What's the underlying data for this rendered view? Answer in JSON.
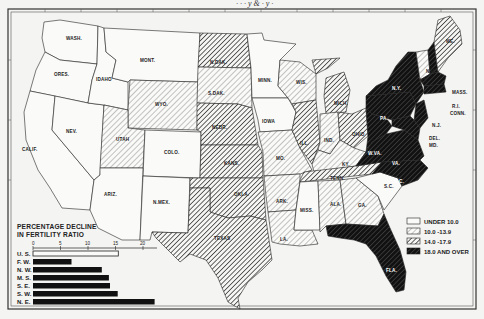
{
  "header": {
    "caption_fragment": "· ·  · y &  · y ·"
  },
  "colors": {
    "background": "#f4f4f2",
    "ink": "#1a1a1a",
    "under_10": "#ffffff",
    "10_13_9": "light-hatch",
    "14_17_9": "medium-hatch",
    "18_and_over": "dark-hatch"
  },
  "map": {
    "title": "Percentage decline in fertility ratio by state",
    "states": [
      {
        "label": "WASH.",
        "category": "under_10"
      },
      {
        "label": "ORES.",
        "category": "under_10"
      },
      {
        "label": "CALIF.",
        "category": "under_10"
      },
      {
        "label": "NEV.",
        "category": "under_10"
      },
      {
        "label": "IDAHO",
        "category": "under_10"
      },
      {
        "label": "MONT.",
        "category": "under_10"
      },
      {
        "label": "WYO.",
        "category": "10_13_9"
      },
      {
        "label": "UTAH",
        "category": "10_13_9"
      },
      {
        "label": "COLO.",
        "category": "under_10"
      },
      {
        "label": "ARIZ.",
        "category": "under_10"
      },
      {
        "label": "N.MEX.",
        "category": "under_10"
      },
      {
        "label": "N.DAK.",
        "category": "14_17_9"
      },
      {
        "label": "S.DAK.",
        "category": "10_13_9"
      },
      {
        "label": "NEBR.",
        "category": "14_17_9"
      },
      {
        "label": "KANS.",
        "category": "14_17_9"
      },
      {
        "label": "OKLA.",
        "category": "14_17_9"
      },
      {
        "label": "TEXAS",
        "category": "14_17_9"
      },
      {
        "label": "MINN.",
        "category": "under_10"
      },
      {
        "label": "IOWA",
        "category": "under_10"
      },
      {
        "label": "MO.",
        "category": "10_13_9"
      },
      {
        "label": "ARK.",
        "category": "10_13_9"
      },
      {
        "label": "LA.",
        "category": "10_13_9"
      },
      {
        "label": "WIS.",
        "category": "10_13_9"
      },
      {
        "label": "ILL.",
        "category": "14_17_9"
      },
      {
        "label": "MICH.",
        "category": "14_17_9"
      },
      {
        "label": "IND.",
        "category": "10_13_9"
      },
      {
        "label": "OHIO",
        "category": "14_17_9"
      },
      {
        "label": "KY.",
        "category": "10_13_9"
      },
      {
        "label": "TENN.",
        "category": "14_17_9"
      },
      {
        "label": "MISS.",
        "category": "under_10"
      },
      {
        "label": "ALA.",
        "category": "10_13_9"
      },
      {
        "label": "GA.",
        "category": "10_13_9"
      },
      {
        "label": "FLA.",
        "category": "18_and_over"
      },
      {
        "label": "S.C.",
        "category": "under_10"
      },
      {
        "label": "N.C.",
        "category": "18_and_over"
      },
      {
        "label": "VA.",
        "category": "18_and_over"
      },
      {
        "label": "W.VA.",
        "category": "18_and_over"
      },
      {
        "label": "PA.",
        "category": "18_and_over"
      },
      {
        "label": "N.Y.",
        "category": "18_and_over"
      },
      {
        "label": "N.J.",
        "category": "18_and_over"
      },
      {
        "label": "DEL.",
        "category": "18_and_over"
      },
      {
        "label": "MD.",
        "category": "18_and_over"
      },
      {
        "label": "VT.",
        "category": "10_13_9"
      },
      {
        "label": "N.H.",
        "category": "18_and_over"
      },
      {
        "label": "ME.",
        "category": "14_17_9"
      },
      {
        "label": "MASS.",
        "category": "18_and_over"
      },
      {
        "label": "R.I.",
        "category": "18_and_over"
      },
      {
        "label": "CONN.",
        "category": "18_and_over"
      }
    ]
  },
  "legend": {
    "items": [
      {
        "key": "under_10",
        "label": "UNDER 10.0"
      },
      {
        "key": "10_13_9",
        "label": "10.0 -13.9"
      },
      {
        "key": "14_17_9",
        "label": "14.0 -17.9"
      },
      {
        "key": "18_and_over",
        "label": "18.0 AND OVER"
      }
    ]
  },
  "chart_data": {
    "type": "bar",
    "orientation": "horizontal",
    "title": "PERCENTAGE DECLINE IN FERTILITY RATIO",
    "title_lines": [
      "PERCENTAGE DECLINE",
      "IN FERTILITY RATIO"
    ],
    "categories": [
      "U. S.",
      "F. W.",
      "N. W.",
      "M. S.",
      "S. E.",
      "S. W.",
      "N. E."
    ],
    "values": [
      15.5,
      7.0,
      12.5,
      13.8,
      14.0,
      15.4,
      22.1
    ],
    "highlight": {
      "U. S.": "outline"
    },
    "xticks": [
      "0",
      "5",
      "10",
      "15",
      "20"
    ],
    "xlim": [
      0,
      22.5
    ],
    "xlabel": "",
    "ylabel": "",
    "grid": false
  }
}
